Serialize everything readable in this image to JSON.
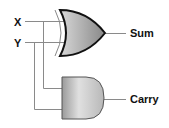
{
  "diagram": {
    "inputs": [
      {
        "label": "X"
      },
      {
        "label": "Y"
      }
    ],
    "gates": [
      {
        "type": "XOR",
        "output_label": "Sum"
      },
      {
        "type": "AND",
        "output_label": "Carry"
      }
    ],
    "colors": {
      "wire": "#8a8a8a",
      "gate_fill_light": "#e8e8e8",
      "gate_fill_dark": "#8c8c8c",
      "gate_outline": "#111111",
      "text": "#111111"
    }
  }
}
